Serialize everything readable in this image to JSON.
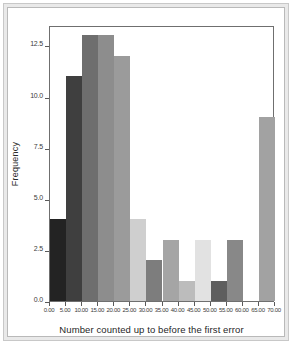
{
  "chart_data": {
    "type": "bar",
    "title": "",
    "subtitle": "",
    "xlabel": "Number counted up to before the first error",
    "ylabel": "Frequency",
    "xlim": [
      0,
      70
    ],
    "ylim": [
      0,
      13.5
    ],
    "grid": false,
    "legend": null,
    "bin_width": 5,
    "x_tick_labels": [
      "0.00",
      "5.00",
      "10.00",
      "15.00",
      "20.00",
      "25.00",
      "30.00",
      "35.00",
      "40.00",
      "45.00",
      "50.00",
      "55.00",
      "60.00",
      "65.00",
      "70.00"
    ],
    "x_tick_values": [
      0,
      5,
      10,
      15,
      20,
      25,
      30,
      35,
      40,
      45,
      50,
      55,
      60,
      65,
      70
    ],
    "y_tick_labels": [
      "0.0",
      "2.5",
      "5.0",
      "7.5",
      "10.0",
      "12.5"
    ],
    "y_tick_values": [
      0,
      2.5,
      5,
      7.5,
      10,
      12.5
    ],
    "categories": [
      "0-5",
      "5-10",
      "10-15",
      "15-20",
      "20-25",
      "25-30",
      "30-35",
      "35-40",
      "40-45",
      "45-50",
      "50-55",
      "55-60",
      "60-65",
      "65-70"
    ],
    "values": [
      4,
      11,
      13,
      13,
      12,
      4,
      2,
      3,
      1,
      3,
      1,
      3,
      0,
      9
    ],
    "bars": [
      {
        "bin_start": 0,
        "bin_end": 5,
        "value": 4,
        "color": "#232323"
      },
      {
        "bin_start": 5,
        "bin_end": 10,
        "value": 11,
        "color": "#3f3f3f"
      },
      {
        "bin_start": 10,
        "bin_end": 15,
        "value": 13,
        "color": "#6e6e6e"
      },
      {
        "bin_start": 15,
        "bin_end": 20,
        "value": 13,
        "color": "#8d8d8d"
      },
      {
        "bin_start": 20,
        "bin_end": 25,
        "value": 12,
        "color": "#9b9b9b"
      },
      {
        "bin_start": 25,
        "bin_end": 30,
        "value": 4,
        "color": "#cfcfcf"
      },
      {
        "bin_start": 30,
        "bin_end": 35,
        "value": 2,
        "color": "#7d7d7d"
      },
      {
        "bin_start": 35,
        "bin_end": 40,
        "value": 3,
        "color": "#a5a5a5"
      },
      {
        "bin_start": 40,
        "bin_end": 45,
        "value": 1,
        "color": "#bcbcbc"
      },
      {
        "bin_start": 45,
        "bin_end": 50,
        "value": 3,
        "color": "#e2e2e2"
      },
      {
        "bin_start": 50,
        "bin_end": 55,
        "value": 1,
        "color": "#5e5e5e"
      },
      {
        "bin_start": 55,
        "bin_end": 60,
        "value": 3,
        "color": "#888888"
      },
      {
        "bin_start": 60,
        "bin_end": 65,
        "value": 0,
        "color": "#ffffff"
      },
      {
        "bin_start": 65,
        "bin_end": 70,
        "value": 9,
        "color": "#a2a2a2"
      }
    ]
  },
  "figure": {
    "frame_color": "#c8c8c8",
    "panel_border_color": "#6f6f6f",
    "background": "#ffffff",
    "axis_text_color": "#3b3b3b"
  }
}
